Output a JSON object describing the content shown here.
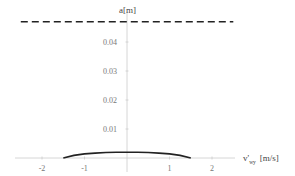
{
  "chart_data": {
    "type": "line",
    "title": "",
    "xlabel": "v'wy [m/s]",
    "xlabel_main": "v'",
    "xlabel_sub": "wy",
    "xlabel_unit": "[m/s]",
    "ylabel": "a[m]",
    "xlim": [
      -2.9,
      2.6
    ],
    "ylim": [
      0,
      0.05
    ],
    "x_ticks": [
      -2,
      -1,
      1,
      2
    ],
    "x_tick_labels": [
      "-2",
      "-1",
      "1",
      "2"
    ],
    "y_ticks": [
      0.01,
      0.02,
      0.03,
      0.04
    ],
    "y_tick_labels": [
      "0.01",
      "0.02",
      "0.03",
      "0.04"
    ],
    "grid": false,
    "legend": null,
    "series": [
      {
        "name": "a(v'wy)",
        "style": "solid",
        "color": "#222222",
        "x": [
          -1.5,
          -1.25,
          -1.0,
          -0.75,
          -0.5,
          -0.25,
          0.0,
          0.25,
          0.5,
          0.75,
          1.0,
          1.25,
          1.5
        ],
        "y": [
          0.0,
          0.0009,
          0.0014,
          0.0017,
          0.0019,
          0.002,
          0.002,
          0.002,
          0.0019,
          0.0017,
          0.0014,
          0.0009,
          0.0
        ]
      },
      {
        "name": "limit",
        "style": "dashed",
        "color": "#222222",
        "x": [
          -2.5,
          2.5
        ],
        "y": [
          0.047,
          0.047
        ]
      }
    ]
  }
}
